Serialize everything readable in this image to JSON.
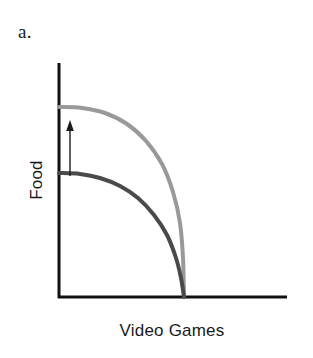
{
  "figure": {
    "panel_label": "a.",
    "background_color": "#ffffff"
  },
  "axis": {
    "x_title": "Video Games",
    "y_title": "Food",
    "axis_color": "#111111",
    "x_axis_y_px": 297,
    "x_axis_x_start_px": 58,
    "x_axis_x_end_px": 287,
    "y_axis_x_px": 59,
    "y_axis_y_top_px": 63,
    "y_axis_y_bottom_px": 297
  },
  "annotations": {
    "arrow": {
      "name": "upward-shift-arrow",
      "direction": "up",
      "color": "#1a1a1a",
      "x_px": 70,
      "y_tail_px": 176,
      "y_head_px": 122,
      "meaning": "outward shift of the production possibilities frontier"
    }
  },
  "chart_data": {
    "type": "line",
    "title": "a.",
    "xlabel": "Video Games",
    "ylabel": "Food",
    "xlim": [
      0,
      1
    ],
    "ylim": [
      0,
      1
    ],
    "grid": false,
    "legend": "none",
    "series": [
      {
        "name": "Original frontier",
        "color": "#4a4a4a",
        "line_width_px": 4,
        "y_intercept_px": 173,
        "x_intercept_px": 184,
        "points_px": [
          [
            59,
            173
          ],
          [
            80,
            174
          ],
          [
            100,
            178
          ],
          [
            120,
            186
          ],
          [
            138,
            198
          ],
          [
            154,
            215
          ],
          [
            167,
            235
          ],
          [
            176,
            258
          ],
          [
            181,
            278
          ],
          [
            184,
            297
          ]
        ]
      },
      {
        "name": "Shifted frontier",
        "color": "#999999",
        "line_width_px": 4,
        "y_intercept_px": 107,
        "x_intercept_px": 184,
        "points_px": [
          [
            59,
            107
          ],
          [
            82,
            108
          ],
          [
            105,
            113
          ],
          [
            127,
            124
          ],
          [
            146,
            141
          ],
          [
            162,
            164
          ],
          [
            173,
            192
          ],
          [
            180,
            223
          ],
          [
            183,
            258
          ],
          [
            184,
            297
          ]
        ]
      }
    ]
  }
}
